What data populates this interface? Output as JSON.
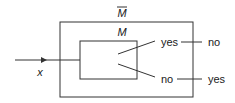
{
  "diagram": {
    "outer_machine_label": "M",
    "outer_machine_overline": true,
    "inner_machine_label": "M",
    "input_label": "x",
    "inner_outputs": [
      "yes",
      "no"
    ],
    "outer_outputs": [
      "no",
      "yes"
    ],
    "colors": {
      "stroke": "#333333",
      "text": "#1a1a1a"
    }
  }
}
